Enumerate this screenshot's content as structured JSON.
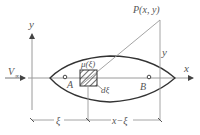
{
  "diagram": {
    "type": "thin-airfoil-source-distribution",
    "colors": {
      "line": "#9a9a9a",
      "body": "#333333",
      "text": "#555555"
    },
    "labels": {
      "y_axis": "y",
      "x_axis": "x",
      "freestream": "V",
      "freestream_sub": "∞",
      "point_P": "P(x, y)",
      "y_height": "y",
      "source_strength": "μ(ξ)",
      "element_width": "dξ",
      "point_A": "A",
      "point_B": "B",
      "dim_xi": "ξ",
      "dim_x_minus_xi": "x−ξ"
    }
  }
}
